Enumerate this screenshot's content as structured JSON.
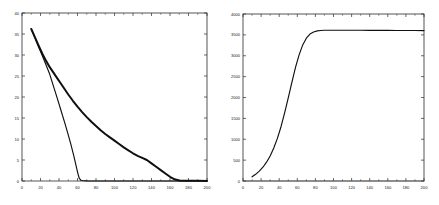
{
  "figure": {
    "background": "#ffffff",
    "axis_color": "#2b2b2b",
    "curve_color": "#101010",
    "panel_count": 2
  },
  "chart_data": [
    {
      "type": "line",
      "title": "",
      "subtitle": "",
      "xlabel": "",
      "ylabel": "",
      "panel": "left",
      "grid": false,
      "legend": "none",
      "xlim": [
        0,
        200
      ],
      "ylim": [
        0,
        40
      ],
      "xticks": [
        0,
        20,
        40,
        60,
        80,
        100,
        120,
        140,
        160,
        180,
        200
      ],
      "yticks": [
        0,
        5,
        10,
        15,
        20,
        25,
        30,
        35,
        40
      ],
      "xtick_labels": [
        "0",
        "20",
        "40",
        "60",
        "80",
        "100",
        "120",
        "140",
        "160",
        "180",
        "200"
      ],
      "ytick_labels": [
        "0",
        "5",
        "10",
        "15",
        "20",
        "25",
        "30",
        "35",
        "40"
      ],
      "annotations": [],
      "series": [
        {
          "name": "slow-decay",
          "style": "thick-markers",
          "x": [
            10,
            14,
            18,
            22,
            26,
            30,
            34,
            38,
            42,
            46,
            50,
            55,
            60,
            65,
            70,
            75,
            80,
            85,
            90,
            95,
            100,
            105,
            110,
            115,
            120,
            125,
            130,
            135,
            140,
            145,
            150,
            155,
            160,
            165,
            170,
            180,
            190,
            200
          ],
          "y": [
            36.2,
            34.2,
            32.2,
            30.3,
            28.6,
            27.1,
            25.8,
            24.5,
            23.2,
            21.9,
            20.6,
            19.1,
            17.7,
            16.4,
            15.2,
            14.1,
            13.1,
            12.1,
            11.2,
            10.4,
            9.6,
            8.8,
            8.0,
            7.3,
            6.6,
            6.0,
            5.5,
            5.0,
            4.2,
            3.4,
            2.6,
            1.8,
            1.0,
            0.4,
            0.12,
            0.05,
            0.03,
            0.02
          ]
        },
        {
          "name": "fast-decay",
          "style": "thin-markers",
          "x": [
            10,
            14,
            18,
            22,
            26,
            30,
            34,
            38,
            42,
            46,
            50,
            53,
            56,
            58,
            60,
            61,
            62,
            64,
            70,
            80,
            100,
            140,
            180,
            200
          ],
          "y": [
            36.2,
            34.1,
            31.9,
            29.8,
            27.6,
            25.4,
            22.6,
            19.8,
            16.9,
            14.0,
            11.0,
            8.6,
            6.0,
            4.1,
            2.2,
            1.3,
            0.6,
            0.12,
            0.02,
            0.01,
            0.01,
            0.01,
            0.01,
            0.01
          ]
        }
      ]
    },
    {
      "type": "line",
      "title": "",
      "subtitle": "",
      "xlabel": "",
      "ylabel": "",
      "panel": "right",
      "grid": false,
      "legend": "none",
      "xlim": [
        0,
        200
      ],
      "ylim": [
        0,
        4000
      ],
      "xticks": [
        0,
        20,
        40,
        60,
        80,
        100,
        120,
        140,
        160,
        180,
        200
      ],
      "yticks": [
        0,
        500,
        1000,
        1500,
        2000,
        2500,
        3000,
        3500,
        4000
      ],
      "xtick_labels": [
        "0",
        "20",
        "40",
        "60",
        "80",
        "100",
        "120",
        "140",
        "160",
        "180",
        "200"
      ],
      "ytick_labels": [
        "0",
        "500",
        "1000",
        "1500",
        "2000",
        "2500",
        "3000",
        "3500",
        "4000"
      ],
      "annotations": [],
      "series": [
        {
          "name": "cumulative-sigmoid",
          "style": "thin",
          "plateau": 3600,
          "x": [
            10,
            14,
            18,
            22,
            26,
            30,
            34,
            38,
            42,
            46,
            50,
            54,
            58,
            62,
            66,
            70,
            74,
            78,
            82,
            86,
            90,
            100,
            110,
            120,
            130,
            140,
            150,
            160,
            170,
            180,
            190,
            200
          ],
          "y": [
            100,
            160,
            235,
            330,
            450,
            600,
            790,
            1020,
            1300,
            1630,
            1990,
            2360,
            2720,
            3020,
            3260,
            3420,
            3520,
            3570,
            3595,
            3605,
            3610,
            3612,
            3612,
            3611,
            3610,
            3609,
            3608,
            3607,
            3606,
            3605,
            3604,
            3603
          ]
        },
        {
          "name": "baseline",
          "style": "fine",
          "x": [
            0,
            200
          ],
          "y": [
            0,
            0
          ]
        }
      ]
    }
  ]
}
